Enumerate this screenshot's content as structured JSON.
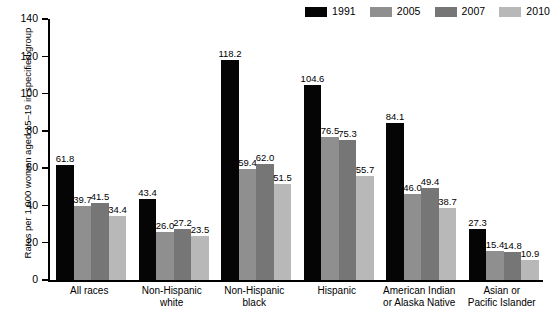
{
  "chart_data": {
    "type": "bar",
    "title": "",
    "xlabel": "",
    "ylabel": "Rates per 1,000 women aged 15–19 in specified group",
    "ylim": [
      0,
      140
    ],
    "yticks": [
      0,
      20,
      40,
      60,
      80,
      100,
      120,
      140
    ],
    "grid": false,
    "legend_position": "top-right",
    "categories": [
      "All races",
      "Non-Hispanic white",
      "Non-Hispanic black",
      "Hispanic",
      "American Indian or Alaska Native",
      "Asian or Pacific Islander"
    ],
    "category_lines": [
      [
        "All races"
      ],
      [
        "Non-Hispanic",
        "white"
      ],
      [
        "Non-Hispanic",
        "black"
      ],
      [
        "Hispanic"
      ],
      [
        "American Indian",
        "or Alaska Native"
      ],
      [
        "Asian or",
        "Pacific Islander"
      ]
    ],
    "series": [
      {
        "name": "1991",
        "color": "#050505",
        "values": [
          61.8,
          43.4,
          118.2,
          104.6,
          84.1,
          27.3
        ],
        "labels": [
          "61.8",
          "43.4",
          "118.2",
          "104.6",
          "84.1",
          "27.3"
        ]
      },
      {
        "name": "2005",
        "color": "#8f8f8f",
        "values": [
          39.7,
          26.0,
          59.4,
          76.5,
          46.0,
          15.4
        ],
        "labels": [
          "39.7",
          "26.0",
          "59.4",
          "76.5",
          "46.0",
          "15.4"
        ]
      },
      {
        "name": "2007",
        "color": "#767676",
        "values": [
          41.5,
          27.2,
          62.0,
          75.3,
          49.4,
          14.8
        ],
        "labels": [
          "41.5",
          "27.2",
          "62.0",
          "75.3",
          "49.4",
          "14.8"
        ]
      },
      {
        "name": "2010",
        "color": "#b8b8b8",
        "values": [
          34.4,
          23.5,
          51.5,
          55.7,
          38.7,
          10.9
        ],
        "labels": [
          "34.4",
          "23.5",
          "51.5",
          "55.7",
          "38.7",
          "10.9"
        ]
      }
    ]
  },
  "legend": {
    "items": [
      {
        "label": "1991",
        "color": "#050505"
      },
      {
        "label": "2005",
        "color": "#8f8f8f"
      },
      {
        "label": "2007",
        "color": "#767676"
      },
      {
        "label": "2010",
        "color": "#b8b8b8"
      }
    ]
  },
  "axis": {
    "y_label": "Rates per 1,000 women aged 15–19 in specified group",
    "y_ticks": [
      "0",
      "20",
      "40",
      "60",
      "80",
      "100",
      "120",
      "140"
    ]
  }
}
